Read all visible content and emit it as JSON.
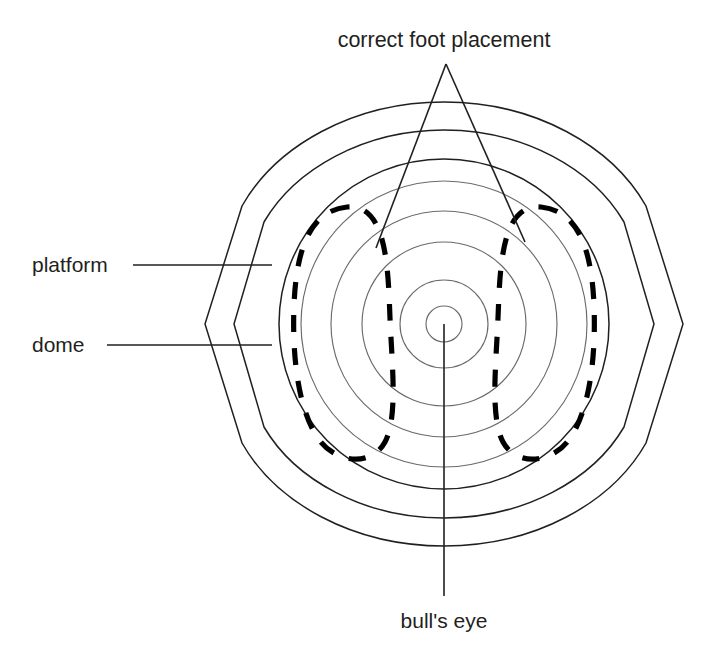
{
  "diagram": {
    "type": "annotated-top-view-diagram",
    "background_color": "#ffffff",
    "line_color": "#231f20",
    "faint_line_color": "#6b6b6b",
    "labels": {
      "title": "correct foot placement",
      "platform": "platform",
      "dome": "dome",
      "bullseye": "bull's eye"
    },
    "geometry": {
      "center": {
        "x": 444,
        "y": 324
      },
      "platform_outer_radius": 222,
      "platform_inner_radius": 194,
      "dome_outer_radius": 165,
      "ring_radii": [
        165,
        143,
        113,
        82,
        44,
        18
      ],
      "handle_left_x": 205,
      "handle_right_x": 683,
      "handle_y": 324
    },
    "annotations": [
      {
        "name": "correct-foot-placement",
        "text": "correct foot placement",
        "text_x": 444,
        "text_y": 47,
        "anchor": "middle",
        "leader": "v-shape"
      },
      {
        "name": "platform",
        "text": "platform",
        "text_x": 32,
        "text_y": 272,
        "anchor": "start",
        "leader": "horizontal"
      },
      {
        "name": "dome",
        "text": "dome",
        "text_x": 32,
        "text_y": 352,
        "anchor": "start",
        "leader": "horizontal"
      },
      {
        "name": "bulls-eye",
        "text": "bull's eye",
        "text_x": 444,
        "text_y": 628,
        "anchor": "middle",
        "leader": "vertical"
      }
    ]
  }
}
